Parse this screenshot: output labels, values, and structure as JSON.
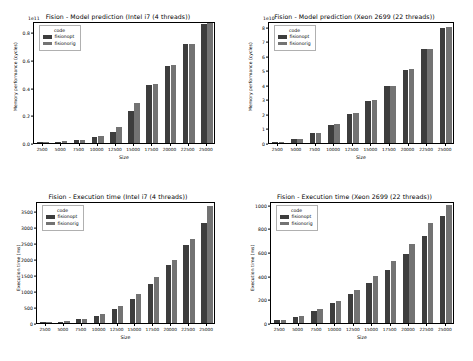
{
  "figure": {
    "background": "#ffffff",
    "series_colors": {
      "fisionopt": "#3d3d3d",
      "fisionorig": "#737373"
    },
    "legend_title": "code"
  },
  "chart_data": [
    {
      "id": "model-prediction-intel-i7",
      "type": "bar",
      "title": "Fision - Model prediction (Intel i7 (4 threads))",
      "xlabel": "Size",
      "ylabel": "Memory performance (cycles)",
      "exponent_label": "1e11",
      "categories": [
        "2500",
        "5000",
        "7500",
        "10000",
        "12500",
        "15000",
        "17500",
        "20000",
        "22500",
        "25000"
      ],
      "ytick_labels": [
        "0.0",
        "0.2",
        "0.4",
        "0.6",
        "0.8"
      ],
      "ytick_values": [
        0.0,
        0.2,
        0.4,
        0.6,
        0.8
      ],
      "ylim": [
        0,
        0.88
      ],
      "grid": false,
      "legend_position": "upper left",
      "series": [
        {
          "name": "fisionopt",
          "values": [
            0.002,
            0.01,
            0.021,
            0.042,
            0.082,
            0.232,
            0.419,
            0.558,
            0.712,
            0.862
          ]
        },
        {
          "name": "fisionorig",
          "values": [
            0.003,
            0.012,
            0.024,
            0.05,
            0.119,
            0.287,
            0.429,
            0.562,
            0.714,
            0.866
          ]
        }
      ]
    },
    {
      "id": "model-prediction-xeon-2699",
      "type": "bar",
      "title": "Fision - Model prediction (Xeon 2699 (22 threads))",
      "xlabel": "Size",
      "ylabel": "Memory performance (cycles)",
      "exponent_label": "1e10",
      "categories": [
        "2500",
        "5000",
        "7500",
        "10000",
        "12500",
        "15000",
        "17500",
        "20000",
        "22500",
        "25000"
      ],
      "ytick_labels": [
        "0",
        "1",
        "2",
        "3",
        "4",
        "5",
        "6",
        "7",
        "8"
      ],
      "ytick_values": [
        0,
        1,
        2,
        3,
        4,
        5,
        6,
        7,
        8
      ],
      "ylim": [
        0,
        8.4
      ],
      "grid": false,
      "legend_position": "upper left",
      "series": [
        {
          "name": "fisionopt",
          "values": [
            0.04,
            0.3,
            0.68,
            1.26,
            2.02,
            2.9,
            3.9,
            5.05,
            6.45,
            7.95
          ]
        },
        {
          "name": "fisionorig",
          "values": [
            0.05,
            0.31,
            0.7,
            1.28,
            2.05,
            2.93,
            3.93,
            5.08,
            6.48,
            7.98
          ]
        }
      ]
    },
    {
      "id": "execution-time-intel-i7",
      "type": "bar",
      "title": "Fision - Execution time (Intel i7 (4 threads))",
      "xlabel": "Size",
      "ylabel": "Execution time (ms)",
      "exponent_label": "",
      "categories": [
        "2500",
        "5000",
        "7500",
        "10000",
        "12500",
        "15000",
        "17500",
        "20000",
        "22500",
        "25000"
      ],
      "ytick_labels": [
        "0",
        "500",
        "1000",
        "1500",
        "2000",
        "2500",
        "3000",
        "3500"
      ],
      "ytick_values": [
        0,
        500,
        1000,
        1500,
        2000,
        2500,
        3000,
        3500
      ],
      "ylim": [
        0,
        3800
      ],
      "grid": false,
      "legend_position": "upper left",
      "series": [
        {
          "name": "fisionopt",
          "values": [
            15,
            40,
            110,
            230,
            430,
            760,
            1230,
            1800,
            2440,
            3130
          ]
        },
        {
          "name": "fisionorig",
          "values": [
            18,
            48,
            135,
            280,
            520,
            900,
            1420,
            1950,
            2630,
            3640
          ]
        }
      ]
    },
    {
      "id": "execution-time-xeon-2699",
      "type": "bar",
      "title": "Fision - Execution time (Xeon 2699 (22 threads))",
      "xlabel": "Size",
      "ylabel": "Execution time (ms)",
      "exponent_label": "",
      "categories": [
        "2500",
        "5000",
        "7500",
        "10000",
        "12500",
        "15000",
        "17500",
        "20000",
        "22500",
        "25000"
      ],
      "ytick_labels": [
        "0",
        "200",
        "400",
        "600",
        "800",
        "1000"
      ],
      "ytick_values": [
        0,
        200,
        400,
        600,
        800,
        1000
      ],
      "ylim": [
        0,
        1030
      ],
      "grid": false,
      "legend_position": "upper left",
      "series": [
        {
          "name": "fisionopt",
          "values": [
            22,
            52,
            105,
            165,
            245,
            340,
            450,
            580,
            735,
            900
          ]
        },
        {
          "name": "fisionorig",
          "values": [
            25,
            58,
            118,
            190,
            282,
            400,
            520,
            670,
            845,
            1000
          ]
        }
      ]
    }
  ]
}
